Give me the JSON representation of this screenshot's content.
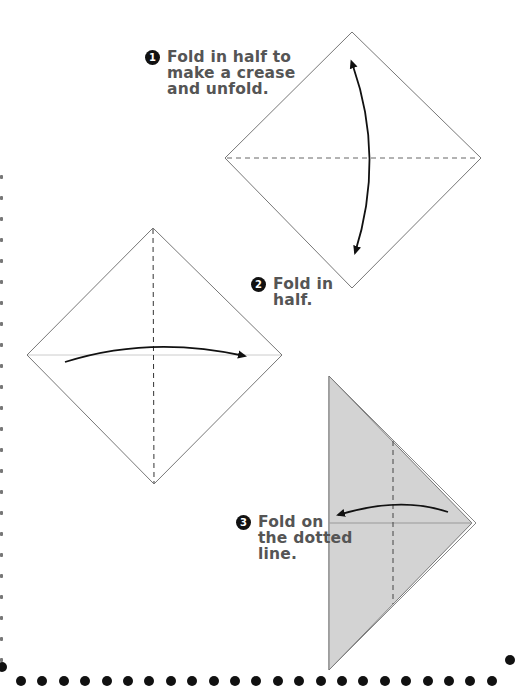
{
  "steps": [
    {
      "number": "1",
      "text": "Fold in half to\nmake a crease\nand unfold."
    },
    {
      "number": "2",
      "text": "Fold in\nhalf."
    },
    {
      "number": "3",
      "text": "Fold on\nthe dotted\nline."
    }
  ],
  "colors": {
    "text": "#555555",
    "badge": "#111111",
    "paper_outline": "#777777",
    "folded_fill": "#d3d3d3",
    "border_dots": "#111111"
  },
  "icons": {
    "step1_arrow": "double-headed-curved-arrow",
    "step2_arrow": "curved-arrow-right",
    "step3_arrow": "curved-arrow-left"
  },
  "border": {
    "style": "dotted",
    "bottom_dot_count": 23
  }
}
